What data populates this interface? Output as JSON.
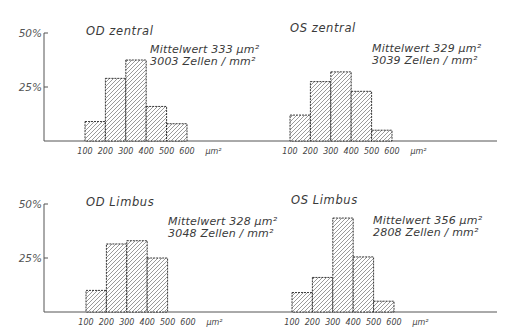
{
  "chart_data": [
    {
      "type": "bar",
      "title": "OD zentral",
      "categories": [
        "100-200",
        "200-300",
        "300-400",
        "400-500",
        "500-600"
      ],
      "values": [
        9,
        29,
        37.5,
        16,
        8
      ],
      "annotation": [
        "Mittelwert 333 µm²",
        "3003 Zellen / mm²"
      ],
      "xtick_labels": [
        "100",
        "200",
        "300",
        "400",
        "500",
        "600"
      ],
      "xunit": "µm²",
      "ytick_labels": [
        "25%",
        "50%"
      ],
      "ylim": [
        0,
        50
      ],
      "xlabel": "µm²",
      "ylabel": "%",
      "grid": false,
      "legend": null
    },
    {
      "type": "bar",
      "title": "OS zentral",
      "categories": [
        "100-200",
        "200-300",
        "300-400",
        "400-500",
        "500-600"
      ],
      "values": [
        12,
        27.5,
        32,
        23,
        5
      ],
      "annotation": [
        "Mittelwert 329 µm²",
        "3039 Zellen / mm²"
      ],
      "xtick_labels": [
        "100",
        "200",
        "300",
        "400",
        "500",
        "600"
      ],
      "xunit": "µm²",
      "ytick_labels": [
        "25%",
        "50%"
      ],
      "ylim": [
        0,
        50
      ],
      "xlabel": "µm²",
      "ylabel": "%",
      "grid": false,
      "legend": null
    },
    {
      "type": "bar",
      "title": "OD Limbus",
      "categories": [
        "100-200",
        "200-300",
        "300-400",
        "400-500",
        "500-600"
      ],
      "values": [
        10,
        31.5,
        33,
        25,
        0
      ],
      "annotation": [
        "Mittelwert 328 µm²",
        "3048 Zellen / mm²"
      ],
      "xtick_labels": [
        "100",
        "200",
        "300",
        "400",
        "500",
        "600"
      ],
      "xunit": "µm²",
      "ytick_labels": [
        "25%",
        "50%"
      ],
      "ylim": [
        0,
        50
      ],
      "xlabel": "µm²",
      "ylabel": "%",
      "grid": false,
      "legend": null
    },
    {
      "type": "bar",
      "title": "OS Limbus",
      "categories": [
        "100-200",
        "200-300",
        "300-400",
        "400-500",
        "500-600"
      ],
      "values": [
        9,
        16,
        43.5,
        25.5,
        5
      ],
      "annotation": [
        "Mittelwert 356 µm²",
        "2808 Zellen / mm²"
      ],
      "xtick_labels": [
        "100",
        "200",
        "300",
        "400",
        "500",
        "600"
      ],
      "xunit": "µm²",
      "ytick_labels": [
        "25%",
        "50%"
      ],
      "ylim": [
        0,
        50
      ],
      "xlabel": "µm²",
      "ylabel": "%",
      "grid": false,
      "legend": null
    }
  ],
  "layout": {
    "rows": [
      {
        "baseline": 141,
        "axis_x": 44,
        "axis_top": 33,
        "axis_end": 497
      },
      {
        "baseline": 312,
        "axis_x": 44,
        "axis_top": 204,
        "axis_end": 497
      }
    ],
    "panels": [
      {
        "row": 0,
        "x0": 85,
        "title_x": 86,
        "title_y": 35,
        "annot_x": 150,
        "annot_y": 53
      },
      {
        "row": 0,
        "x0": 290,
        "title_x": 290,
        "title_y": 32,
        "annot_x": 372,
        "annot_y": 52
      },
      {
        "row": 1,
        "x0": 86,
        "title_x": 86,
        "title_y": 206,
        "annot_x": 168,
        "annot_y": 225
      },
      {
        "row": 1,
        "x0": 292,
        "title_x": 291,
        "title_y": 204,
        "annot_x": 373,
        "annot_y": 224
      }
    ],
    "bar_width": 20.4,
    "px_per_percent": 2.16
  },
  "colors": {
    "ink": "#222222",
    "text": "#3a3a3a",
    "background": "#ffffff"
  }
}
